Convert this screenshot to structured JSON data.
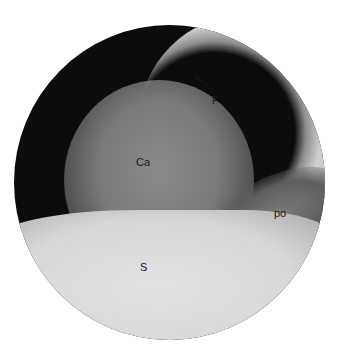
{
  "image": {
    "description": "Grayscale circular endoscopic view with anatomical labels",
    "labels": [
      {
        "id": "F",
        "text": "F"
      },
      {
        "id": "Ca",
        "text": "Ca"
      },
      {
        "id": "po",
        "text": "po"
      },
      {
        "id": "S",
        "text": "S"
      }
    ],
    "annotations": {
      "arrow": {
        "points_to": "upper-left",
        "near_label": "F"
      }
    },
    "colors": {
      "background": "#ffffff",
      "frame": "#0c0c0c",
      "label_text": "#1a1a1a"
    }
  }
}
